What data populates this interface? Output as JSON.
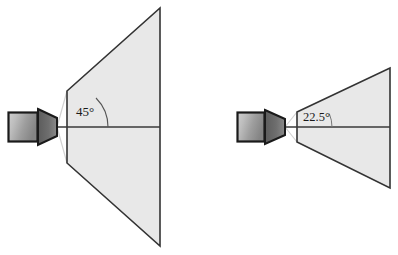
{
  "figure": {
    "background_color": "#ffffff"
  },
  "colors": {
    "frustum_fill": "#e8e8e8",
    "frustum_stroke": "#333333",
    "axis_line": "#3a3a3a",
    "camera_body_dark": "#4a4a4a",
    "camera_body_light": "#d4d4d4",
    "camera_body_mid": "#9a9a9a",
    "camera_outline": "#1a1a1a",
    "lens_fill": "#6f6f6f",
    "ray_line": "#cfcfcf",
    "label_text": "#1a1a1a",
    "arc_stroke": "#555555"
  },
  "cameras": [
    {
      "id": "wide-angle-camera",
      "name": "left-camera",
      "angle_label": "45°",
      "angle_degrees": 45,
      "body": {
        "x": 8,
        "y": 112,
        "width": 30,
        "height": 30
      },
      "lens": {
        "base_x": 38,
        "tip_x": 57,
        "top_y": 109,
        "bottom_y": 145,
        "axis_y": 127
      },
      "apex": {
        "x": 57,
        "y": 127
      },
      "near_plane_x": 67,
      "far_plane_x": 160,
      "far_top_y": 8,
      "far_bottom_y": 246,
      "near_top_y": 91,
      "near_bottom_y": 163,
      "axis": {
        "x1": 38,
        "y1": 127,
        "x2": 160,
        "y2": 127
      },
      "arc": {
        "cx": 67,
        "cy": 127,
        "radius": 41
      },
      "label_pos": {
        "x": 76,
        "y": 113
      }
    },
    {
      "id": "narrow-angle-camera",
      "name": "right-camera",
      "angle_label": "22.5°",
      "angle_degrees": 22.5,
      "body": {
        "x": 237,
        "y": 112,
        "width": 28,
        "height": 30
      },
      "lens": {
        "base_x": 265,
        "tip_x": 285,
        "top_y": 110,
        "bottom_y": 144,
        "axis_y": 127
      },
      "apex": {
        "x": 285,
        "y": 127
      },
      "near_plane_x": 297,
      "far_plane_x": 390,
      "far_top_y": 68,
      "far_bottom_y": 188,
      "near_top_y": 112,
      "near_bottom_y": 142,
      "axis": {
        "x1": 265,
        "y1": 127,
        "x2": 390,
        "y2": 127
      },
      "arc": {
        "cx": 297,
        "cy": 127,
        "radius": 35
      },
      "label_pos": {
        "x": 303,
        "y": 118
      }
    }
  ],
  "annotations": {
    "left_angle_text": "45°",
    "right_angle_text": "22.5°"
  }
}
